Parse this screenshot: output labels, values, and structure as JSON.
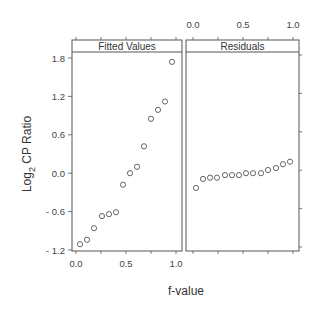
{
  "chart_data": {
    "type": "scatter",
    "layout": "trellis-two-panels",
    "xlabel": "f-value",
    "ylabel": "Log2 CP Ratio",
    "ylabel_main": "Log",
    "ylabel_sub": "2",
    "ylabel_rest": " CP Ratio",
    "ylim": [
      -1.2,
      1.8
    ],
    "xlim": [
      0.0,
      1.0
    ],
    "y_ticks": [
      1.8,
      1.2,
      0.6,
      0.0,
      -0.6,
      -1.2
    ],
    "y_tick_labels": [
      "1.8",
      "1.2",
      "0.6",
      "0.0",
      "- 0.6",
      "- 1.2"
    ],
    "x_ticks": [
      0.0,
      0.5,
      1.0
    ],
    "x_tick_labels": [
      "0.0",
      "0.5",
      "1.0"
    ],
    "grid": false,
    "legend": null,
    "marker": "open-circle",
    "panels": [
      {
        "title": "Fitted Values",
        "x_axis_position": "bottom",
        "x": [
          0.04,
          0.11,
          0.18,
          0.26,
          0.33,
          0.4,
          0.47,
          0.54,
          0.61,
          0.68,
          0.75,
          0.82,
          0.89,
          0.96
        ],
        "y": [
          -1.11,
          -1.04,
          -0.86,
          -0.67,
          -0.64,
          -0.61,
          -0.18,
          0.0,
          0.1,
          0.42,
          0.85,
          0.99,
          1.12,
          1.74
        ]
      },
      {
        "title": "Residuals",
        "x_axis_position": "top",
        "x": [
          0.03,
          0.1,
          0.17,
          0.24,
          0.32,
          0.39,
          0.46,
          0.53,
          0.6,
          0.68,
          0.75,
          0.83,
          0.9,
          0.97
        ],
        "y": [
          -0.23,
          -0.09,
          -0.07,
          -0.07,
          -0.03,
          -0.03,
          -0.03,
          0.0,
          0.0,
          0.0,
          0.05,
          0.08,
          0.14,
          0.18
        ]
      }
    ]
  },
  "colors": {
    "frame": "#555555",
    "marker": "#555555",
    "text": "#333333",
    "background": "#ffffff"
  }
}
